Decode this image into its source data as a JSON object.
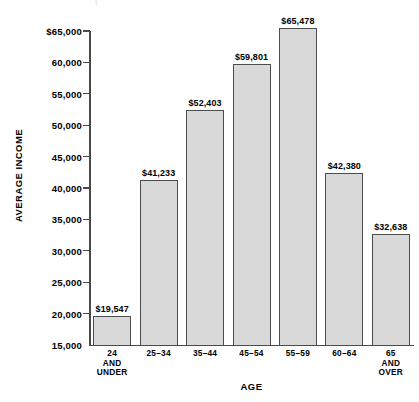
{
  "chart_data": {
    "type": "bar",
    "title": "",
    "xlabel": "AGE",
    "ylabel": "AVERAGE INCOME",
    "categories": [
      "24\nAND\nUNDER",
      "25–34",
      "35–44",
      "45–54",
      "55–59",
      "60–64",
      "65\nAND\nOVER"
    ],
    "values": [
      19547,
      41233,
      52403,
      59801,
      65478,
      42380,
      32638
    ],
    "data_labels": [
      "$19,547",
      "$41,233",
      "$52,403",
      "$59,801",
      "$65,478",
      "$42,380",
      "$32,638"
    ],
    "ylim": [
      15000,
      65000
    ],
    "ytick_values": [
      65000,
      60000,
      55000,
      50000,
      45000,
      40000,
      35000,
      30000,
      25000,
      20000,
      15000
    ],
    "ytick_labels": [
      "$65,000",
      "60,000",
      "55,000",
      "50,000",
      "45,000",
      "40,000",
      "35,000",
      "30,000",
      "25,000",
      "20,000",
      "15,000"
    ],
    "grid": false,
    "legend": null,
    "bar_fill_color": "#d9d9d9",
    "bar_edge_color": "#4d4d4d",
    "axis_color": "#4a4a4a",
    "background_color": "#ffffff"
  },
  "top_remnant_text": "|"
}
